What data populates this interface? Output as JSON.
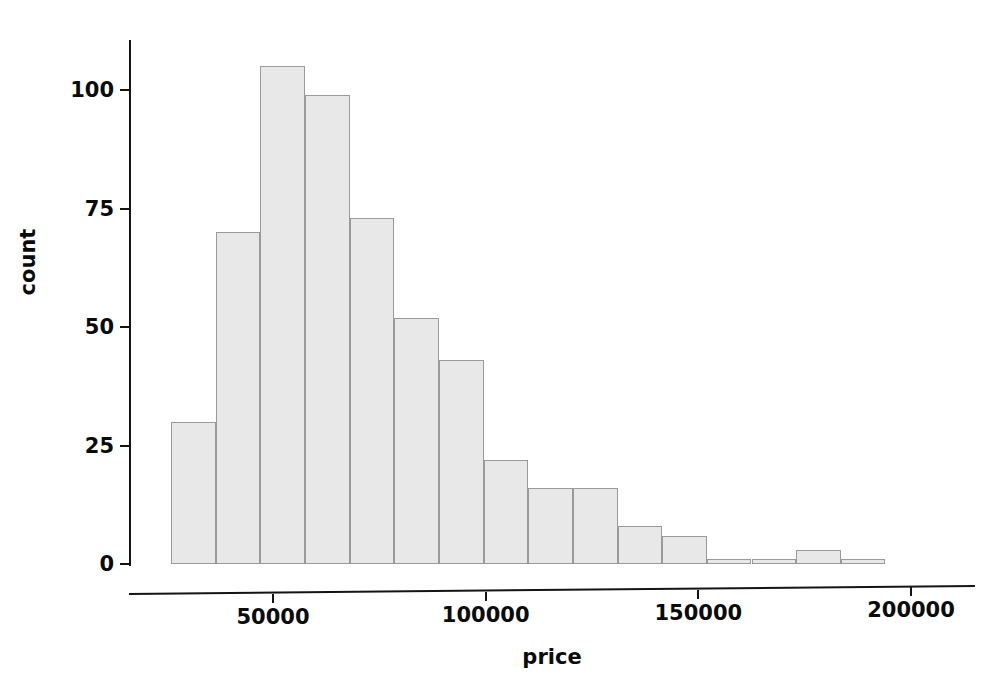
{
  "chart_data": {
    "type": "bar",
    "title": "",
    "subtitle": "",
    "xlabel": "price",
    "ylabel": "count",
    "grid": false,
    "legend": false,
    "legend_position": "none",
    "bar_color": "#e8e8e8",
    "bar_edge_color": "#9a9a9a",
    "axis_color": "#141414",
    "background": "#ffffff",
    "xlim": [
      22000,
      200000
    ],
    "ylim": [
      0,
      107
    ],
    "xticks": [
      50000,
      100000,
      150000,
      200000
    ],
    "xtick_labels": [
      "50000",
      "100000",
      "150000",
      "200000"
    ],
    "yticks": [
      0,
      25,
      50,
      75,
      100
    ],
    "ytick_labels": [
      "0",
      "25",
      "50",
      "75",
      "100"
    ],
    "bin_width": 10500,
    "bin_edges": [
      26000,
      36500,
      47000,
      57500,
      68000,
      78500,
      89000,
      99500,
      110000,
      120500,
      131000,
      141500,
      152000,
      162500,
      173000,
      183500,
      194000
    ],
    "categories": [
      "26000-36500",
      "36500-47000",
      "47000-57500",
      "57500-68000",
      "68000-78500",
      "78500-89000",
      "89000-99500",
      "99500-110000",
      "110000-120500",
      "120500-131000",
      "131000-141500",
      "141500-152000",
      "152000-162500",
      "162500-173000",
      "173000-183500",
      "183500-194000"
    ],
    "values": [
      30,
      70,
      105,
      99,
      73,
      52,
      43,
      22,
      16,
      16,
      8,
      6,
      1,
      1,
      3,
      1
    ]
  }
}
